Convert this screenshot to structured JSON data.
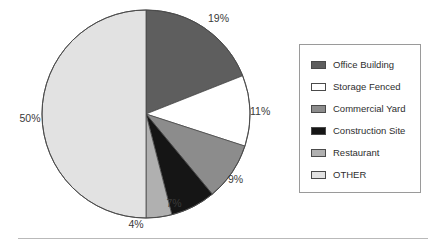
{
  "chart_data": {
    "type": "pie",
    "title": "",
    "labels": [
      "Office Building",
      "Storage Fenced",
      "Commercial Yard",
      "Construction Site",
      "Restaurant",
      "OTHER"
    ],
    "values": [
      19,
      11,
      9,
      7,
      4,
      50
    ],
    "value_labels": [
      "19%",
      "11%",
      "9%",
      "7%",
      "4%",
      "50%"
    ],
    "colors": [
      "#5e5e5e",
      "#ffffff",
      "#8c8c8c",
      "#151515",
      "#b0b0b0",
      "#e2e2e2"
    ],
    "start_angle_deg": 0,
    "direction": "clockwise",
    "legend_position": "right",
    "grid": false,
    "units": "percent"
  },
  "legend": {
    "items": [
      {
        "label": "Office Building",
        "color": "#5e5e5e"
      },
      {
        "label": "Storage Fenced",
        "color": "#ffffff"
      },
      {
        "label": "Commercial Yard",
        "color": "#8c8c8c"
      },
      {
        "label": "Construction Site",
        "color": "#151515"
      },
      {
        "label": "Restaurant",
        "color": "#b0b0b0"
      },
      {
        "label": "OTHER",
        "color": "#e2e2e2"
      }
    ]
  },
  "slice_labels": {
    "office_building": "19%",
    "storage_fenced": "11%",
    "commercial_yard": "9%",
    "construction_site": "7%",
    "restaurant": "4%",
    "other": "50%"
  }
}
